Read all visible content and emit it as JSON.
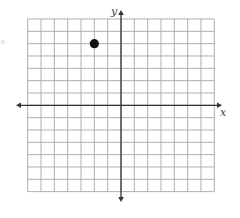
{
  "chart_data": {
    "type": "scatter",
    "title": "",
    "xlabel": "x",
    "ylabel": "y",
    "xlim": [
      -7,
      7
    ],
    "ylim": [
      -7,
      7
    ],
    "grid": true,
    "grid_step": 1,
    "tick_labels": "none",
    "series": [
      {
        "name": "point",
        "points": [
          {
            "x": -2,
            "y": 5
          }
        ]
      }
    ]
  },
  "axes": {
    "x_label": "x",
    "y_label": "y"
  },
  "layout": {
    "grid_left": 27.7,
    "grid_top": 19,
    "cell_w": 13.33,
    "cell_h": 12.33,
    "cols": 14,
    "rows": 14,
    "x_axis_arrow_left": 16,
    "x_axis_arrow_right": 222,
    "y_axis_arrow_top": 10,
    "y_axis_arrow_bottom": 202,
    "point_radius": 4.6
  },
  "colors": {
    "grid": "#a6a6a6",
    "axis": "#333333",
    "point": "#111111",
    "label": "#444444"
  },
  "artifact_mark": "s"
}
